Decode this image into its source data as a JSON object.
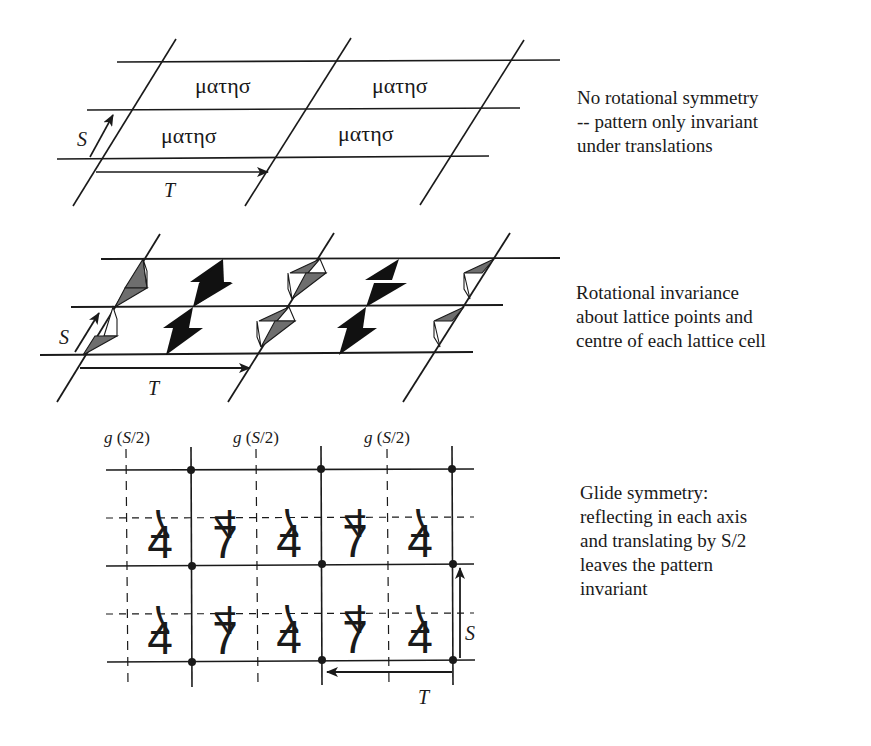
{
  "panels": [
    {
      "id": "translation",
      "caption": [
        "No rotational symmetry",
        " -- pattern only invariant",
        "under translations"
      ],
      "motif_text": "ματησσ",
      "motif_label": "ματησ",
      "vector_labels": {
        "s": "S",
        "t": "T"
      }
    },
    {
      "id": "rotation",
      "caption": [
        "Rotational invariance",
        "about lattice points and",
        "centre of each lattice cell"
      ],
      "vector_labels": {
        "s": "S",
        "t": "T"
      },
      "fill_colors": {
        "dark": "#111111",
        "grey": "#6e6e6e"
      }
    },
    {
      "id": "glide",
      "caption": [
        "Glide symmetry:",
        "reflecting in each axis",
        "and translating by S/2",
        "leaves the pattern",
        "invariant"
      ],
      "glide_labels": [
        "g (S/2)",
        "g (S/2)",
        "g (S/2)"
      ],
      "glide_label_parts": {
        "g": "g",
        "open": " (",
        "s": "S",
        "rest": "/2)"
      },
      "upper_glyph": "7",
      "lower_glyph": "4",
      "rows": [
        [
          "7̅",
          "4̅",
          "7̅",
          "4̅",
          "7̅"
        ],
        [
          "4",
          "7",
          "4",
          "7",
          "4"
        ]
      ],
      "vector_labels": {
        "s": "S",
        "t": "T"
      }
    }
  ],
  "colors": {
    "ink": "#1a1a1a",
    "grey_fill": "#6e6e6e",
    "background": "#ffffff"
  }
}
